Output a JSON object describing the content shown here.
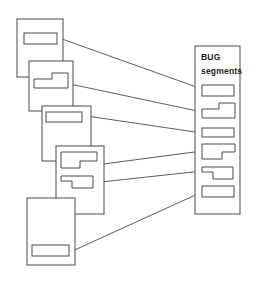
{
  "diagram": {
    "title_line1": "BUG",
    "title_line2": "segments",
    "stroke_color": "#4a4a4a",
    "background_color": "#ffffff",
    "text_color": "#1a1a1a",
    "documents": [
      {
        "name": "document-1",
        "box": {
          "x": 17,
          "y": 19,
          "w": 46,
          "h": 58
        },
        "segment": {
          "type": "rect",
          "x": 24,
          "y": 33,
          "w": 33,
          "h": 11
        }
      },
      {
        "name": "document-2",
        "box": {
          "x": 29,
          "y": 61,
          "w": 44,
          "h": 50
        },
        "segment": {
          "type": "notch",
          "x": 34,
          "y": 73,
          "w": 34,
          "h": 15,
          "notch_w": 18,
          "notch_h": 6
        }
      },
      {
        "name": "document-3",
        "box": {
          "x": 42,
          "y": 106,
          "w": 49,
          "h": 55
        },
        "segment": {
          "type": "rect",
          "x": 46,
          "y": 112,
          "w": 36,
          "h": 10
        }
      },
      {
        "name": "document-4",
        "box": {
          "x": 56,
          "y": 146,
          "w": 48,
          "h": 68
        },
        "segment_a": {
          "type": "notch",
          "x": 61,
          "y": 152,
          "w": 36,
          "h": 16,
          "notch_w": 19,
          "notch_h": 7
        },
        "segment_b": {
          "type": "notch-left",
          "x": 61,
          "y": 176,
          "w": 32,
          "h": 12,
          "notch_w": 11,
          "notch_h": 5
        }
      },
      {
        "name": "document-5",
        "box": {
          "x": 27,
          "y": 198,
          "w": 48,
          "h": 67
        },
        "segment": {
          "type": "rect",
          "x": 32,
          "y": 245,
          "w": 37,
          "h": 11
        }
      }
    ],
    "panel": {
      "name": "bug-segments-panel",
      "box": {
        "x": 195,
        "y": 46,
        "w": 45,
        "h": 168
      },
      "segments": [
        {
          "name": "bug-segment-1",
          "type": "rect",
          "x": 202,
          "y": 85,
          "w": 32,
          "h": 11
        },
        {
          "name": "bug-segment-2",
          "type": "notch",
          "x": 202,
          "y": 103,
          "w": 33,
          "h": 15,
          "notch_w": 18,
          "notch_h": 6
        },
        {
          "name": "bug-segment-3",
          "type": "rect",
          "x": 202,
          "y": 128,
          "w": 32,
          "h": 9
        },
        {
          "name": "bug-segment-4",
          "type": "notch",
          "x": 202,
          "y": 144,
          "w": 33,
          "h": 15,
          "notch_w": 20,
          "notch_h": 7
        },
        {
          "name": "bug-segment-5",
          "type": "notch-left",
          "x": 202,
          "y": 167,
          "w": 31,
          "h": 12,
          "notch_w": 11,
          "notch_h": 5
        },
        {
          "name": "bug-segment-6",
          "type": "rect",
          "x": 202,
          "y": 186,
          "w": 32,
          "h": 11
        }
      ]
    },
    "links": [
      {
        "name": "link-doc1-to-segment1",
        "x1": 62,
        "y1": 39,
        "x2": 202,
        "y2": 89
      },
      {
        "name": "link-doc2-to-segment2",
        "x1": 70,
        "y1": 84,
        "x2": 202,
        "y2": 112
      },
      {
        "name": "link-doc3-to-segment3",
        "x1": 80,
        "y1": 115,
        "x2": 202,
        "y2": 133
      },
      {
        "name": "link-doc4a-to-segment4",
        "x1": 96,
        "y1": 165,
        "x2": 202,
        "y2": 151
      },
      {
        "name": "link-doc4b-to-segment5",
        "x1": 92,
        "y1": 183,
        "x2": 202,
        "y2": 171
      },
      {
        "name": "link-doc5-to-segment6",
        "x1": 68,
        "y1": 253,
        "x2": 202,
        "y2": 192
      }
    ]
  }
}
